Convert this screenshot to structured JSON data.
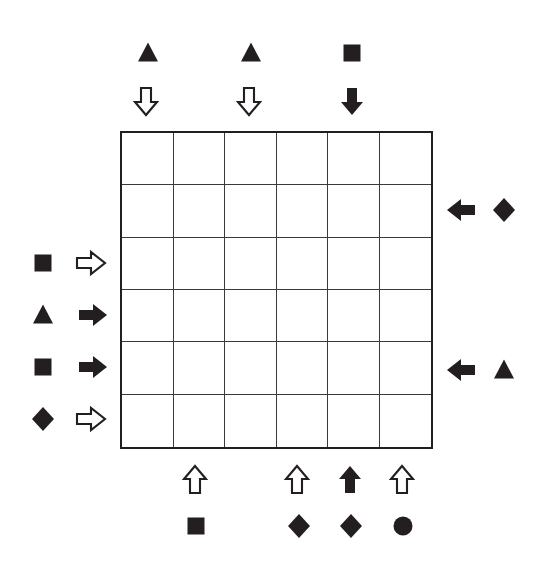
{
  "puzzle": {
    "title": "six-by-six grid logic puzzle",
    "grid": {
      "columns": 6,
      "rows": 6,
      "left_px": 120,
      "top_px": 131,
      "width_px": 313,
      "height_px": 318,
      "cell_size_px": 52,
      "border_color": "#231f20",
      "inner_line_color": "#3a3a3c",
      "background_color": "#ffffff",
      "cells": [
        [
          "",
          "",
          "",
          "",
          "",
          ""
        ],
        [
          "",
          "",
          "",
          "",
          "",
          ""
        ],
        [
          "",
          "",
          "",
          "",
          "",
          ""
        ],
        [
          "",
          "",
          "",
          "",
          "",
          ""
        ],
        [
          "",
          "",
          "",
          "",
          "",
          ""
        ],
        [
          "",
          "",
          "",
          "",
          "",
          ""
        ]
      ]
    },
    "page_background_color": "#ffffff",
    "shape_color": "#231f20",
    "clues": {
      "top": [
        {
          "column": 1,
          "shape": "triangle",
          "shape_style": "filled",
          "shape_icon": "triangle-filled-icon",
          "shape_x": 148,
          "shape_y": 53,
          "arrow": "arrow-down",
          "arrow_style": "hollow",
          "arrow_icon": "arrow-down-hollow-icon",
          "arrow_x": 146,
          "arrow_y": 101
        },
        {
          "column": 3,
          "shape": "triangle",
          "shape_style": "filled",
          "shape_icon": "triangle-filled-icon",
          "shape_x": 251,
          "shape_y": 53,
          "arrow": "arrow-down",
          "arrow_style": "hollow",
          "arrow_icon": "arrow-down-hollow-icon",
          "arrow_x": 249,
          "arrow_y": 101
        },
        {
          "column": 5,
          "shape": "square",
          "shape_style": "filled",
          "shape_icon": "square-filled-icon",
          "shape_x": 352,
          "shape_y": 53,
          "arrow": "arrow-down",
          "arrow_style": "filled",
          "arrow_icon": "arrow-down-filled-icon",
          "arrow_x": 352,
          "arrow_y": 101
        }
      ],
      "left": [
        {
          "row": 3,
          "shape": "square",
          "shape_style": "filled",
          "shape_icon": "square-filled-icon",
          "shape_x": 43,
          "shape_y": 263,
          "arrow": "arrow-right",
          "arrow_style": "hollow",
          "arrow_icon": "arrow-right-hollow-icon",
          "arrow_x": 91,
          "arrow_y": 263
        },
        {
          "row": 4,
          "shape": "triangle",
          "shape_style": "filled",
          "shape_icon": "triangle-filled-icon",
          "shape_x": 43,
          "shape_y": 315,
          "arrow": "arrow-right",
          "arrow_style": "filled",
          "arrow_icon": "arrow-right-filled-icon",
          "arrow_x": 93,
          "arrow_y": 315
        },
        {
          "row": 5,
          "shape": "square",
          "shape_style": "filled",
          "shape_icon": "square-filled-icon",
          "shape_x": 43,
          "shape_y": 367,
          "arrow": "arrow-right",
          "arrow_style": "filled",
          "arrow_icon": "arrow-right-filled-icon",
          "arrow_x": 93,
          "arrow_y": 367
        },
        {
          "row": 6,
          "shape": "diamond",
          "shape_style": "filled",
          "shape_icon": "diamond-filled-icon",
          "shape_x": 43,
          "shape_y": 419,
          "arrow": "arrow-right",
          "arrow_style": "hollow",
          "arrow_icon": "arrow-right-hollow-icon",
          "arrow_x": 91,
          "arrow_y": 419
        }
      ],
      "right": [
        {
          "row": 2,
          "arrow": "arrow-left",
          "arrow_style": "filled",
          "arrow_icon": "arrow-left-filled-icon",
          "arrow_x": 461,
          "arrow_y": 210,
          "shape": "diamond",
          "shape_style": "filled",
          "shape_icon": "diamond-filled-icon",
          "shape_x": 504,
          "shape_y": 210
        },
        {
          "row": 5,
          "arrow": "arrow-left",
          "arrow_style": "filled",
          "arrow_icon": "arrow-left-filled-icon",
          "arrow_x": 461,
          "arrow_y": 370,
          "shape": "triangle",
          "shape_style": "filled",
          "shape_icon": "triangle-filled-icon",
          "shape_x": 504,
          "shape_y": 370
        }
      ],
      "bottom": [
        {
          "column": 2,
          "arrow": "arrow-up",
          "arrow_style": "hollow",
          "arrow_icon": "arrow-up-hollow-icon",
          "arrow_x": 195,
          "arrow_y": 480,
          "shape": "square",
          "shape_style": "filled",
          "shape_icon": "square-filled-icon",
          "shape_x": 196,
          "shape_y": 526
        },
        {
          "column": 4,
          "arrow": "arrow-up",
          "arrow_style": "hollow",
          "arrow_icon": "arrow-up-hollow-icon",
          "arrow_x": 297,
          "arrow_y": 480,
          "shape": "diamond",
          "shape_style": "filled",
          "shape_icon": "diamond-filled-icon",
          "shape_x": 299,
          "shape_y": 526
        },
        {
          "column": 5,
          "arrow": "arrow-up",
          "arrow_style": "filled",
          "arrow_icon": "arrow-up-filled-icon",
          "arrow_x": 350,
          "arrow_y": 480,
          "shape": "diamond",
          "shape_style": "filled",
          "shape_icon": "diamond-filled-icon",
          "shape_x": 351,
          "shape_y": 526
        },
        {
          "column": 6,
          "arrow": "arrow-up",
          "arrow_style": "hollow",
          "arrow_icon": "arrow-up-hollow-icon",
          "arrow_x": 402,
          "arrow_y": 480,
          "shape": "circle",
          "shape_style": "filled",
          "shape_icon": "circle-filled-icon",
          "shape_x": 403,
          "shape_y": 526
        }
      ]
    }
  }
}
